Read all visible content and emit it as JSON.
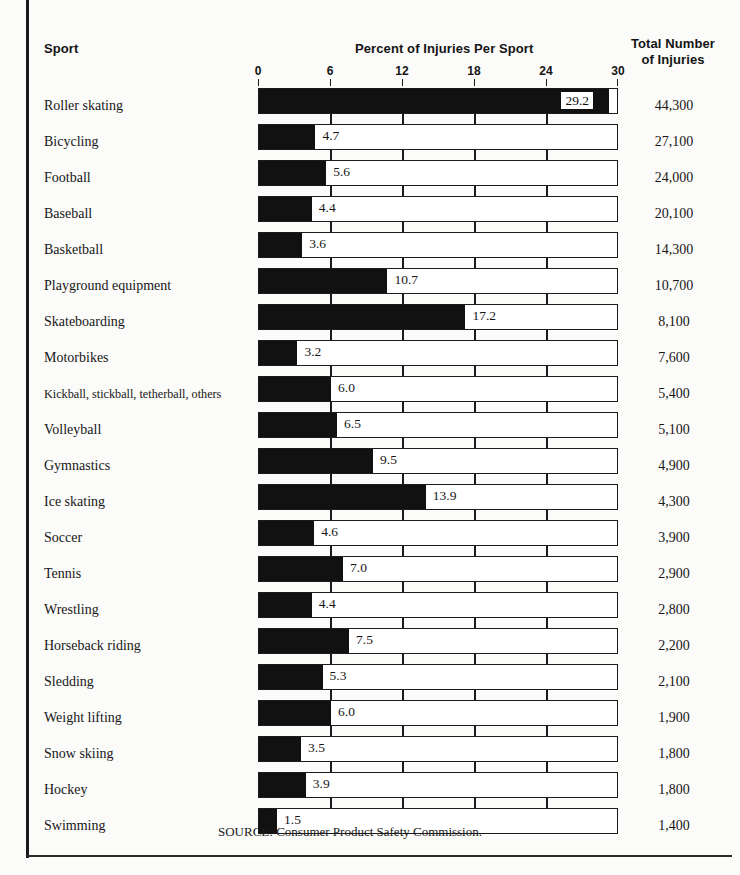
{
  "header": {
    "sport_label": "Sport",
    "percent_label": "Percent of Injuries Per Sport",
    "total_label_line1": "Total Number",
    "total_label_line2": "of Injuries"
  },
  "source": "SOURCE: Consumer Product Safety Commission.",
  "colors": {
    "bar_fill": "#111111",
    "bar_outline": "#1b1b1b",
    "page_background": "#fbfbf9",
    "text": "#171717"
  },
  "chart_data": {
    "type": "bar",
    "orientation": "horizontal",
    "title": "Percent of Injuries Per Sport",
    "xlabel": "Percent of Injuries Per Sport",
    "ylabel": "Sport",
    "xlim": [
      0,
      30
    ],
    "xticks": [
      0,
      6,
      12,
      18,
      24,
      30
    ],
    "xtick_labels": [
      "0",
      "6",
      "12",
      "18",
      "24",
      "30"
    ],
    "grid": false,
    "legend": null,
    "categories": [
      "Roller skating",
      "Bicycling",
      "Football",
      "Baseball",
      "Basketball",
      "Playground equipment",
      "Skateboarding",
      "Motorbikes",
      "Kickball, stickball, tetherball, others",
      "Volleyball",
      "Gymnastics",
      "Ice skating",
      "Soccer",
      "Tennis",
      "Wrestling",
      "Horseback riding",
      "Sledding",
      "Weight lifting",
      "Snow skiing",
      "Hockey",
      "Swimming"
    ],
    "values": [
      29.2,
      4.7,
      5.6,
      4.4,
      3.6,
      10.7,
      17.2,
      3.2,
      6.0,
      6.5,
      9.5,
      13.9,
      4.6,
      7.0,
      4.4,
      7.5,
      5.3,
      6.0,
      3.5,
      3.9,
      1.5
    ],
    "value_labels": [
      "29.2",
      "4.7",
      "5.6",
      "4.4",
      "3.6",
      "10.7",
      "17.2",
      "3.2",
      "6.0",
      "6.5",
      "9.5",
      "13.9",
      "4.6",
      "7.0",
      "4.4",
      "7.5",
      "5.3",
      "6.0",
      "3.5",
      "3.9",
      "1.5"
    ],
    "secondary_series": {
      "name": "Total Number of Injuries",
      "values": [
        44300,
        27100,
        24000,
        20100,
        14300,
        10700,
        8100,
        7600,
        5400,
        5100,
        4900,
        4300,
        3900,
        2900,
        2800,
        2200,
        2100,
        1900,
        1800,
        1800,
        1400
      ],
      "labels": [
        "44,300",
        "27,100",
        "24,000",
        "20,100",
        "14,300",
        "10,700",
        "8,100",
        "7,600",
        "5,400",
        "5,100",
        "4,900",
        "4,300",
        "3,900",
        "2,900",
        "2,800",
        "2,200",
        "2,100",
        "1,900",
        "1,800",
        "1,800",
        "1,400"
      ]
    }
  }
}
